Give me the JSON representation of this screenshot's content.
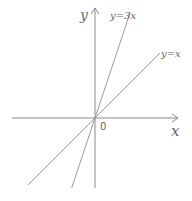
{
  "diagram": {
    "axes": {
      "x_label": "x",
      "y_label": "y",
      "origin_label": "0"
    },
    "lines": [
      {
        "label": "y=3x",
        "slope": 3
      },
      {
        "label": "y=x",
        "slope": 1
      }
    ]
  }
}
